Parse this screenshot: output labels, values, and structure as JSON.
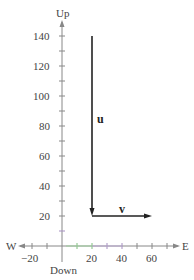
{
  "diagram": {
    "axes": {
      "up_label": "Up",
      "down_label": "Down",
      "west_label": "W",
      "east_label": "E",
      "y_ticks": [
        "140",
        "120",
        "100",
        "80",
        "60",
        "40",
        "20"
      ],
      "x_ticks": [
        "−20",
        "20",
        "40",
        "60"
      ]
    },
    "vectors": {
      "u": {
        "label": "u",
        "from": [
          20,
          140
        ],
        "to": [
          20,
          20
        ]
      },
      "v": {
        "label": "v",
        "from": [
          20,
          20
        ],
        "to": [
          60,
          20
        ]
      }
    },
    "colors": {
      "axis": "#888888",
      "vector": "#222222",
      "green_tick": "#7fbf7f",
      "purple_tick": "#a58fc0"
    }
  }
}
